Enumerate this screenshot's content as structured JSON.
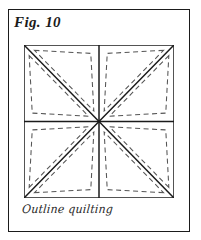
{
  "figure": {
    "label": "Fig. 10",
    "caption": "Outline quilting"
  },
  "colors": {
    "frame": "#1b1b1b",
    "seam_line": "#1b1b1b",
    "stitch_line": "#555555",
    "background": "#ffffff",
    "caption_text": "#2a2a2a"
  },
  "diagram": {
    "type": "quilt-block-pattern",
    "block_shape": "square",
    "size": {
      "width": 150,
      "height": 153
    },
    "quadrants": 4,
    "triangles": 8,
    "seam_lines": [
      {
        "name": "outer-border-top",
        "x1": 0,
        "y1": 0,
        "x2": 150,
        "y2": 0
      },
      {
        "name": "outer-border-right",
        "x1": 150,
        "y1": 0,
        "x2": 150,
        "y2": 153
      },
      {
        "name": "outer-border-bottom",
        "x1": 150,
        "y1": 153,
        "x2": 0,
        "y2": 153
      },
      {
        "name": "outer-border-left",
        "x1": 0,
        "y1": 153,
        "x2": 0,
        "y2": 0
      },
      {
        "name": "divider-vertical",
        "x1": 75,
        "y1": 0,
        "x2": 75,
        "y2": 153
      },
      {
        "name": "divider-horizontal",
        "x1": 0,
        "y1": 76.5,
        "x2": 150,
        "y2": 76.5
      },
      {
        "name": "diagonal-top-left-to-bottom-right",
        "x1": 0,
        "y1": 0,
        "x2": 150,
        "y2": 153
      },
      {
        "name": "diagonal-bottom-left-to-top-right",
        "x1": 0,
        "y1": 153,
        "x2": 150,
        "y2": 0
      }
    ],
    "stitch_style": {
      "pattern": "dashed",
      "dash_length": 5,
      "gap_length": 3.5,
      "inset_from_seam": 5,
      "description": "dashed quilting stitches run parallel to every seam, inset just inside each triangle"
    },
    "stitch_triangles": [
      {
        "name": "stitch-triangle-top-left-upper",
        "points": "0,0 75,0 75,76.5"
      },
      {
        "name": "stitch-triangle-top-left-lower",
        "points": "0,0 75,76.5 0,76.5"
      },
      {
        "name": "stitch-triangle-top-right-upper",
        "points": "150,0 75,0 75,76.5"
      },
      {
        "name": "stitch-triangle-top-right-lower",
        "points": "150,0 75,76.5 150,76.5"
      },
      {
        "name": "stitch-triangle-bottom-left-upper",
        "points": "0,153 75,153 75,76.5"
      },
      {
        "name": "stitch-triangle-bottom-left-lower",
        "points": "0,153 75,76.5 0,76.5"
      },
      {
        "name": "stitch-triangle-bottom-right-upper",
        "points": "150,153 75,153 75,76.5"
      },
      {
        "name": "stitch-triangle-bottom-right-lower",
        "points": "150,153 75,76.5 150,76.5"
      }
    ]
  }
}
